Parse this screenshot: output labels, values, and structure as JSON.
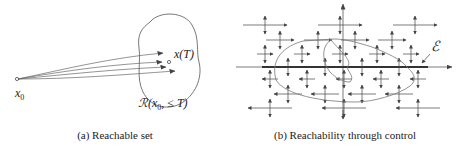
{
  "figure_a": {
    "caption": "(a) Reachable set",
    "start_label": "x",
    "start_sub": "0",
    "target_label": "x(T)",
    "set_label_prefix": "ℛ(x",
    "set_label_sub": "0",
    "set_label_suffix": ", ≤ T)",
    "trajectory_count": 4
  },
  "figure_b": {
    "caption": "(b) Reachability through control",
    "equilibrium_label": "ℰ"
  },
  "colors": {
    "ink": "#222222",
    "curve": "#666666"
  }
}
